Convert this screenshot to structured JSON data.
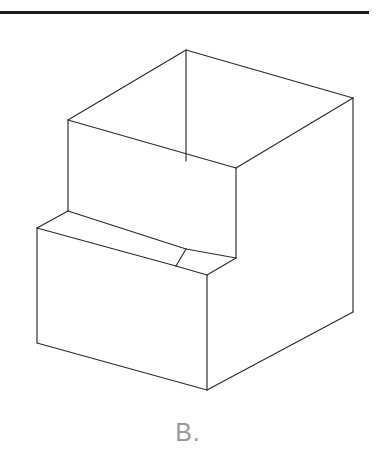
{
  "page": {
    "background_color": "#ffffff",
    "width": 376,
    "height": 461
  },
  "top_rule": {
    "name": "horizontal-divider",
    "color": "#1a1a1a",
    "x": 0,
    "y": 11,
    "width": 369,
    "thickness": 3
  },
  "caption": {
    "label": "B.",
    "color": "#9a9a9a",
    "font_size": 25
  },
  "figure": {
    "projection": "isometric",
    "line_color": "#2b2b2b",
    "fill_color": "#ffffff",
    "line_width": 1.15,
    "vertices": {
      "top_apex_back": [
        186,
        50
      ],
      "top_left_back": [
        68,
        120
      ],
      "top_right": [
        353,
        98
      ],
      "cavity_front_bottom": [
        236,
        168
      ],
      "left_wall_bottom": [
        68,
        211
      ],
      "ledge_front_left": [
        37,
        228
      ],
      "ledge_inner_right": [
        186,
        249
      ],
      "notch_right_top": [
        240,
        258
      ],
      "notch_front": [
        207,
        275
      ],
      "step_vertical_bottom": [
        236,
        258
      ],
      "bottom_left": [
        37,
        343
      ],
      "bottom_front": [
        207,
        390
      ],
      "bottom_right": [
        353,
        312
      ],
      "right_vertical_top": [
        353,
        98
      ],
      "right_vertical_bottom": [
        353,
        312
      ]
    },
    "edges": [
      {
        "name": "top-rear-left-ridge",
        "from": "top_apex_back",
        "to": "top_left_back"
      },
      {
        "name": "top-rear-right-ridge",
        "from": "top_apex_back",
        "to": "top_right"
      },
      {
        "name": "cavity-inner-vertical-back",
        "from": "top_apex_back",
        "to": "cavity_back_inner"
      },
      {
        "name": "cavity-inner-left-edge",
        "from": "top_left_back",
        "to": "cavity_front_bottom"
      },
      {
        "name": "cavity-inner-right-edge",
        "from": "top_right",
        "to": "cavity_front_bottom"
      },
      {
        "name": "left-outer-vertical",
        "from": "top_left_back",
        "to": "left_wall_bottom"
      },
      {
        "name": "right-outer-vertical",
        "from": "top_right",
        "to": "right_vertical_bottom"
      },
      {
        "name": "step-vertical",
        "from": "cavity_front_bottom",
        "to": "step_vertical_bottom"
      },
      {
        "name": "ledge-top-left-edge",
        "from": "left_wall_bottom",
        "to": "ledge_front_left"
      },
      {
        "name": "ledge-top-long-edge",
        "from": "left_wall_bottom",
        "to": "ledge_inner_right"
      },
      {
        "name": "ledge-front-long-edge",
        "from": "ledge_front_left",
        "to": "notch_front"
      },
      {
        "name": "notch-right-edge",
        "from": "ledge_inner_right",
        "to": "notch_right_top"
      },
      {
        "name": "notch-front-edge",
        "from": "notch_front",
        "to": "notch_right_top"
      },
      {
        "name": "front-left-vertical",
        "from": "ledge_front_left",
        "to": "bottom_left"
      },
      {
        "name": "front-center-vertical",
        "from": "notch_front",
        "to": "bottom_front"
      },
      {
        "name": "bottom-left-edge",
        "from": "bottom_left",
        "to": "bottom_front"
      },
      {
        "name": "bottom-right-edge",
        "from": "bottom_front",
        "to": "bottom_right"
      },
      {
        "name": "right-bottom-vertical",
        "from": "bottom_right",
        "to": "right_vertical_bottom"
      }
    ]
  }
}
